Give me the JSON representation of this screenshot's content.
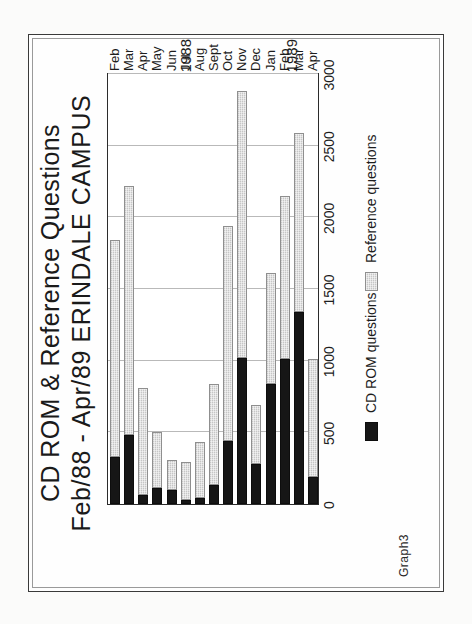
{
  "document": {
    "caption": "Graph3"
  },
  "chart_data": {
    "type": "bar",
    "orientation": "horizontal-stacked",
    "title": "CD ROM & Reference Questions",
    "subtitle": "Feb/88 - Apr/89  ERINDALE CAMPUS",
    "title_lines": [
      "CD ROM & Reference Questions",
      "Feb/88 - Apr/89  ERINDALE CAMPUS"
    ],
    "xlabel": "",
    "ylabel": "",
    "xlim": [
      0,
      3000
    ],
    "grid": true,
    "gridlines_axis": "value",
    "legend_position": "bottom",
    "categories": [
      "Feb",
      "Mar",
      "Apr",
      "May",
      "Jun",
      "Jul",
      "Aug",
      "Sept",
      "Oct",
      "Nov",
      "Dec",
      "Jan",
      "Feb",
      "Mar",
      "Apr"
    ],
    "group_labels": [
      {
        "label": "1988",
        "from": "Feb",
        "to": "Dec"
      },
      {
        "label": "1989",
        "from": "Jan",
        "to": "Apr"
      }
    ],
    "ticks": [
      0,
      500,
      1000,
      1500,
      2000,
      2500,
      3000
    ],
    "tick_labels": [
      "0",
      "500",
      "1000",
      "1500",
      "2000",
      "2500",
      "3000"
    ],
    "series": [
      {
        "name": "CD ROM questions",
        "color": "#161616",
        "values": [
          330,
          480,
          60,
          110,
          100,
          30,
          40,
          130,
          440,
          1020,
          280,
          840,
          1010,
          1340,
          190
        ]
      },
      {
        "name": "Reference questions",
        "color": "#c6c6c6",
        "values": [
          1510,
          1740,
          750,
          390,
          210,
          260,
          390,
          710,
          1500,
          1860,
          410,
          770,
          1140,
          1250,
          820
        ]
      }
    ],
    "totals": [
      1840,
      2220,
      810,
      500,
      310,
      290,
      430,
      840,
      1940,
      2880,
      690,
      1610,
      2150,
      2590,
      1010
    ]
  }
}
